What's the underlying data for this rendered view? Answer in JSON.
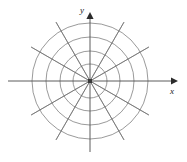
{
  "figure": {
    "name": "polar-coordinate-grid",
    "title": "",
    "background_color": "#ffffff",
    "width": 187,
    "height": 162
  },
  "axes": {
    "x_label": "x",
    "y_label": "y",
    "origin": {
      "x": 90,
      "y": 81
    },
    "x_axis": {
      "start_x": 8,
      "end_x": 178,
      "y": 81,
      "arrow": "right"
    },
    "y_axis": {
      "x": 90,
      "start_y": 152,
      "end_y": 12,
      "arrow": "up"
    },
    "line_color": "#4a4a4a",
    "arrow_color": "#2b2b2b"
  },
  "origin_marker": {
    "label": "origin-dot",
    "size": 4,
    "color": "#3a3a3a"
  },
  "chart_data": {
    "type": "polar-grid",
    "title": "",
    "xlabel": "x",
    "ylabel": "y",
    "grid": true,
    "circle_count": 4,
    "circle_radii": [
      17,
      30,
      44,
      58
    ],
    "radial_line_count": 12,
    "radial_angle_step_deg": 30,
    "radial_angles_deg": [
      0,
      30,
      60,
      90,
      120,
      150,
      180,
      210,
      240,
      270,
      300,
      330
    ],
    "spoke_outer_radius": 68,
    "grid_color": "#6e6e6e",
    "grid_stroke_width": 0.7
  },
  "colors": {
    "grid": "#6e6e6e",
    "axis": "#4a4a4a",
    "label": "#1a1a1a",
    "background": "#ffffff"
  }
}
